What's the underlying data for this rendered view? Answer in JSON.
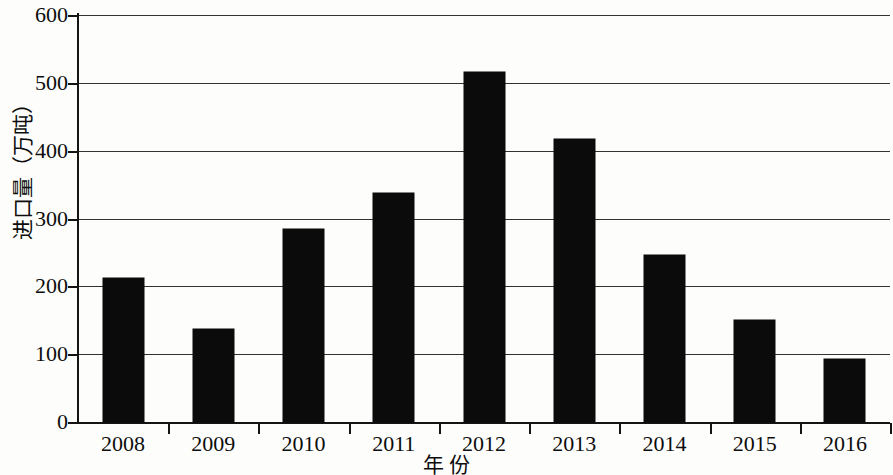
{
  "chart_data": {
    "type": "bar",
    "title": "",
    "subtitle": "",
    "xlabel": "年  份",
    "ylabel": "进口量（万吨）",
    "categories": [
      "2008",
      "2009",
      "2010",
      "2011",
      "2012",
      "2013",
      "2014",
      "2015",
      "2016"
    ],
    "values": [
      212,
      137,
      284,
      338,
      516,
      417,
      246,
      150,
      93
    ],
    "series": [
      {
        "name": "进口量",
        "values": [
          212,
          137,
          284,
          338,
          516,
          417,
          246,
          150,
          93
        ]
      }
    ],
    "ylim": [
      0,
      600
    ],
    "yticks": [
      0,
      100,
      200,
      300,
      400,
      500,
      600
    ],
    "ytick_labels": [
      "0",
      "100",
      "200",
      "300",
      "400",
      "500",
      "600"
    ],
    "grid": true,
    "grid_axis": "y",
    "legend": false,
    "legend_position": "none",
    "bar_color": "#0b0b0b",
    "grid_color": "#33332f",
    "axis_color": "#141414",
    "background_color": "#fdfdfc"
  }
}
